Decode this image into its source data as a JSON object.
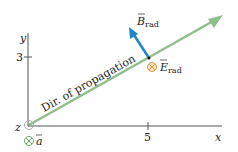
{
  "diagram": {
    "axes": {
      "x_label": "x",
      "y_label": "y",
      "z_label": "z",
      "x_tick": "5",
      "y_tick": "3"
    },
    "propagation_label": "Dir. of propagation",
    "b_field": {
      "symbol": "B",
      "subscript": "rad",
      "color": "#1f86c8"
    },
    "e_field": {
      "symbol": "E",
      "subscript": "rad",
      "color": "#e8963c",
      "direction": "into-page"
    },
    "acceleration": {
      "symbol": "a",
      "direction": "into-page",
      "color": "#6aa86a"
    },
    "colors": {
      "axis": "#555555",
      "propagation_line": "#8fbf8a",
      "b_arrow": "#1f86c8",
      "e_symbol": "#e8963c",
      "text": "#222222"
    }
  }
}
